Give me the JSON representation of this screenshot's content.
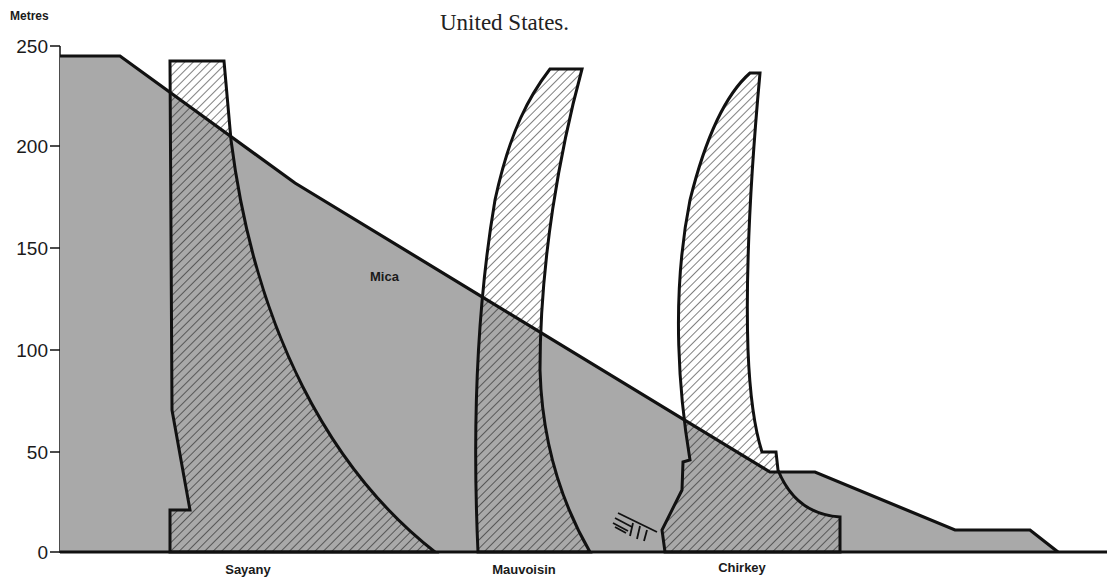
{
  "caption": {
    "line_partial": "p",
    "line2": "United States."
  },
  "axis": {
    "unit": "Metres",
    "ticks": [
      "250",
      "200",
      "150",
      "100",
      "50",
      "0"
    ]
  },
  "dams": {
    "mica": {
      "label": "Mica",
      "type": "embankment",
      "height_m": 243
    },
    "sayany": {
      "label": "Sayany",
      "type": "arch-gravity",
      "height_m": 240
    },
    "mauvoisin": {
      "label": "Mauvoisin",
      "type": "arch",
      "height_m": 237
    },
    "chirkey": {
      "label": "Chirkey",
      "type": "arch",
      "height_m": 233
    }
  },
  "colors": {
    "fill_embankment": "#a9a9a9",
    "outline": "#111111",
    "hatch": "#444444",
    "background": "#ffffff"
  }
}
